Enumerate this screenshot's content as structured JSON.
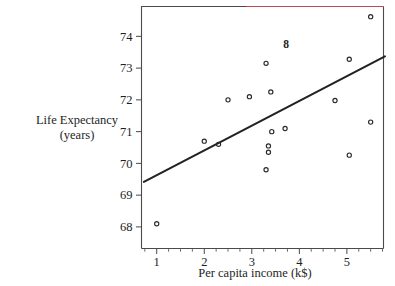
{
  "chart_data": {
    "type": "scatter",
    "title": "",
    "xlabel": "Per capita income (k$)",
    "ylabel": "Life Expectancy (years)",
    "ylabel_line1": "Life Expectancy",
    "ylabel_line2": "(years)",
    "xlim": [
      0.68,
      5.77
    ],
    "ylim": [
      67.32,
      74.94
    ],
    "xticks": [
      1,
      2,
      3,
      4,
      5
    ],
    "xtick_labels": [
      "1",
      "2",
      "3",
      "4",
      "5"
    ],
    "yticks": [
      68,
      69,
      70,
      71,
      72,
      73,
      74
    ],
    "ytick_labels": [
      "68",
      "69",
      "70",
      "71",
      "72",
      "73",
      "74"
    ],
    "x_minor_ticks": [
      0.75,
      1.25,
      1.5,
      1.75,
      2.25,
      2.5,
      2.75,
      3.25,
      3.5,
      3.75,
      4.25,
      4.5,
      4.75,
      5.25,
      5.5,
      5.75
    ],
    "grid": false,
    "legend": null,
    "points": [
      {
        "x": 1.0,
        "y": 68.1
      },
      {
        "x": 2.0,
        "y": 70.7
      },
      {
        "x": 2.3,
        "y": 70.6
      },
      {
        "x": 2.5,
        "y": 72.0
      },
      {
        "x": 2.95,
        "y": 72.1
      },
      {
        "x": 3.3,
        "y": 73.15
      },
      {
        "x": 3.4,
        "y": 72.25
      },
      {
        "x": 3.42,
        "y": 71.0
      },
      {
        "x": 3.7,
        "y": 71.1
      },
      {
        "x": 3.35,
        "y": 70.55
      },
      {
        "x": 3.35,
        "y": 70.35
      },
      {
        "x": 3.3,
        "y": 69.8
      },
      {
        "x": 4.75,
        "y": 71.98
      },
      {
        "x": 5.05,
        "y": 73.28
      },
      {
        "x": 5.05,
        "y": 70.26
      },
      {
        "x": 5.5,
        "y": 71.3
      },
      {
        "x": 5.5,
        "y": 74.62
      }
    ],
    "regression_line": {
      "x_start": 0.73,
      "y_start": 69.42,
      "x_end": 5.8,
      "y_end": 73.37
    },
    "annotations": [
      {
        "text": "8",
        "x": 3.72,
        "y": 73.76
      }
    ]
  },
  "colors": {
    "frame": "#4a4a4a",
    "frame_accent": "#c04a52",
    "marker": "#2a2a2a",
    "line": "#222222",
    "text": "#1e1e1e",
    "background": "#ffffff"
  }
}
